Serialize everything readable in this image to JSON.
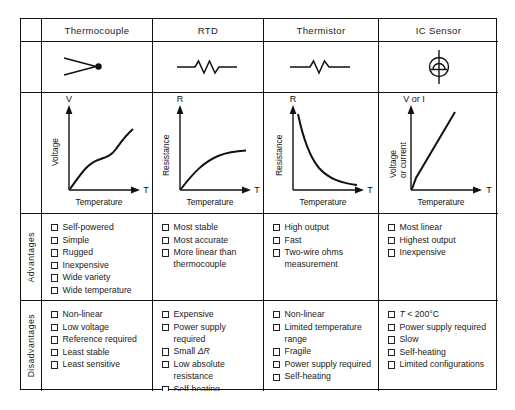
{
  "table": {
    "columns": [
      "Thermocouple",
      "RTD",
      "Thermistor",
      "IC Sensor"
    ],
    "row_labels": {
      "advantages": "Advantages",
      "disadvantages": "Disadvantages"
    },
    "symbols": [
      {
        "name": "thermocouple-symbol",
        "desc": "two wires joined at a junction dot"
      },
      {
        "name": "rtd-resistor-symbol",
        "desc": "zigzag resistor with leads"
      },
      {
        "name": "thermistor-resistor-symbol",
        "desc": "zigzag resistor with leads"
      },
      {
        "name": "ic-sensor-symbol",
        "desc": "circle with dome and vertical leads"
      }
    ],
    "advantages": [
      [
        "Self-powered",
        "Simple",
        "Rugged",
        "Inexpensive",
        "Wide variety",
        "Wide temperature range"
      ],
      [
        "Most stable",
        "Most accurate",
        "More linear than thermocouple"
      ],
      [
        "High output",
        "Fast",
        "Two-wire ohms measurement"
      ],
      [
        "Most linear",
        "Highest output",
        "Inexpensive"
      ]
    ],
    "disadvantages": [
      [
        "Non-linear",
        "Low voltage",
        "Reference required",
        "Least stable",
        "Least sensitive"
      ],
      [
        "Expensive",
        "Power supply required",
        "Small ΔR",
        "Low absolute resistance",
        "Self-heating"
      ],
      [
        "Non-linear",
        "Limited temperature range",
        "Fragile",
        "Power supply required",
        "Self-heating"
      ],
      [
        "T < 200°C",
        "Power supply required",
        "Slow",
        "Self-heating",
        "Limited configurations"
      ]
    ]
  },
  "chart_data": [
    {
      "type": "line",
      "title": "Thermocouple response",
      "xlabel": "Temperature",
      "ylabel": "Voltage",
      "y_axis_symbol": "V",
      "x_axis_symbol": "T",
      "x": [
        0,
        10,
        20,
        30,
        40,
        50,
        60,
        70,
        80,
        90,
        100
      ],
      "y": [
        0,
        14,
        25,
        33,
        39,
        44,
        48,
        53,
        61,
        72,
        84
      ],
      "shape": "monotonic increasing, gently S-shaped / near-linear",
      "grid": false
    },
    {
      "type": "line",
      "title": "RTD response",
      "xlabel": "Temperature",
      "ylabel": "Resistance",
      "y_axis_symbol": "R",
      "x_axis_symbol": "T",
      "x": [
        0,
        10,
        20,
        30,
        40,
        50,
        60,
        70,
        80,
        90,
        100
      ],
      "y": [
        0,
        12,
        22,
        30,
        37,
        42,
        46,
        49,
        51,
        52,
        53
      ],
      "shape": "increasing, saturating (concave down)",
      "grid": false
    },
    {
      "type": "line",
      "title": "Thermistor response",
      "xlabel": "Temperature",
      "ylabel": "Resistance",
      "y_axis_symbol": "R",
      "x_axis_symbol": "T",
      "x": [
        0,
        10,
        20,
        30,
        40,
        50,
        60,
        70,
        80,
        90,
        100
      ],
      "y": [
        96,
        70,
        52,
        39,
        30,
        23,
        18,
        14,
        11,
        9,
        8
      ],
      "shape": "exponential decay, strongly non-linear",
      "grid": false
    },
    {
      "type": "line",
      "title": "IC sensor response",
      "xlabel": "Temperature",
      "ylabel": "Voltage or current",
      "y_axis_symbol": "V or I",
      "x_axis_symbol": "T",
      "x": [
        0,
        8,
        100
      ],
      "y": [
        0,
        14,
        96
      ],
      "shape": "linear",
      "grid": false
    }
  ]
}
